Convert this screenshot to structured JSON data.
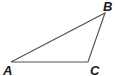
{
  "diagram": {
    "type": "triangle",
    "stroke_color": "#555555",
    "vertices": [
      {
        "label": "A",
        "x": 11,
        "y": 62
      },
      {
        "label": "B",
        "x": 105,
        "y": 13
      },
      {
        "label": "C",
        "x": 88,
        "y": 62
      }
    ],
    "labels": {
      "A": "A",
      "B": "B",
      "C": "C"
    }
  }
}
